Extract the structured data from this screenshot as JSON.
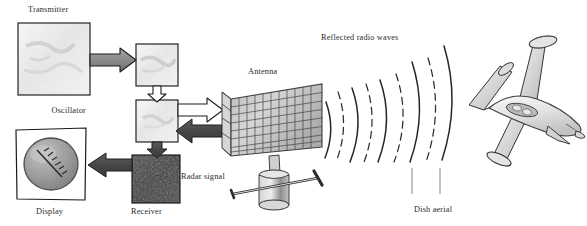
{
  "diagram": {
    "background_color": "#ffffff",
    "ink_color": "#1a1a1a"
  },
  "labels": {
    "transmitter": "Transmitter",
    "oscillator": "Oscillator",
    "display": "Display",
    "receiver": "Receiver",
    "antenna": "Antenna",
    "radar_signal": "Radar signal",
    "reflected_radio_waves": "Reflected radio waves",
    "dish_aerial": "Dish aerial"
  },
  "blocks": [
    {
      "id": "transmitter",
      "label": "Transmitter",
      "fill": "#f2f2f2",
      "x": 18,
      "y": 23,
      "w": 72,
      "h": 72
    },
    {
      "id": "oscillator-upper",
      "label": "",
      "fill": "#f0f0f0",
      "x": 136,
      "y": 44,
      "w": 42,
      "h": 42
    },
    {
      "id": "oscillator",
      "label": "Oscillator",
      "fill": "#f4f4f4",
      "x": 136,
      "y": 100,
      "w": 42,
      "h": 42
    },
    {
      "id": "receiver",
      "label": "Receiver",
      "fill": "#3d3d3d",
      "x": 132,
      "y": 155,
      "w": 48,
      "h": 48
    },
    {
      "id": "display",
      "label": "Display",
      "fill": "#ffffff",
      "x": 16,
      "y": 128,
      "w": 70,
      "h": 72
    }
  ],
  "arrows": [
    {
      "id": "transmitter-to-oscillator",
      "style": "gray",
      "direction": "right",
      "from": "transmitter",
      "to": "oscillator-upper"
    },
    {
      "id": "oscillator-upper-to-oscillator",
      "style": "hollow",
      "direction": "down",
      "from": "oscillator-upper",
      "to": "oscillator"
    },
    {
      "id": "oscillator-to-antenna",
      "style": "hollow",
      "direction": "right",
      "from": "oscillator",
      "to": "antenna"
    },
    {
      "id": "antenna-to-oscillator",
      "style": "dark",
      "direction": "left",
      "from": "antenna",
      "to": "oscillator"
    },
    {
      "id": "oscillator-to-receiver",
      "style": "dark",
      "direction": "down",
      "from": "oscillator",
      "to": "receiver"
    },
    {
      "id": "receiver-to-display",
      "style": "dark",
      "direction": "left",
      "from": "receiver",
      "to": "display"
    }
  ],
  "antenna": {
    "label": "Antenna",
    "type": "planar-mesh-array",
    "mesh_columns": 11,
    "mesh_rows": 7,
    "mount": "cylindrical-pedestal-with-axle"
  },
  "waves": {
    "label": "Reflected radio waves",
    "count": 8,
    "pattern": "alternating-solid-dashed-arcs",
    "solid_color": "#262626",
    "dashed_color": "#2e2e2e"
  },
  "aircraft": {
    "label": "Dish aerial",
    "description": "jet aircraft with swept wings, wingtip tanks and nose dish aerial",
    "body_fill": "#efefef"
  },
  "display_screen": {
    "type": "circular-crt-sweep",
    "fill": "#9a9a9a",
    "sweep_line": true,
    "tick_marks": 6
  }
}
